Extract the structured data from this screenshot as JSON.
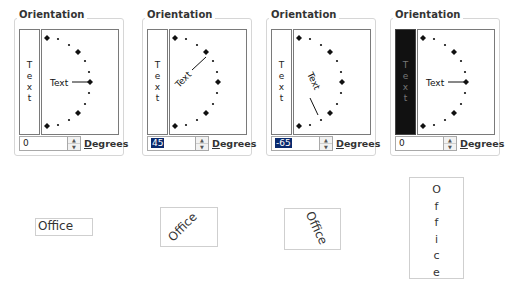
{
  "panels": [
    {
      "title": "Orientation",
      "vertical_text": [
        "T",
        "e",
        "x",
        "t"
      ],
      "vertical_selected": false,
      "dial_label": "Text",
      "angle": 0,
      "degrees_value": "0",
      "degrees_label": "Degrees",
      "input_selected": false
    },
    {
      "title": "Orientation",
      "vertical_text": [
        "T",
        "e",
        "x",
        "t"
      ],
      "vertical_selected": false,
      "dial_label": "Text",
      "angle": 45,
      "degrees_value": "45",
      "degrees_label": "Degrees",
      "input_selected": true
    },
    {
      "title": "Orientation",
      "vertical_text": [
        "T",
        "e",
        "x",
        "t"
      ],
      "vertical_selected": false,
      "dial_label": "Text",
      "angle": -65,
      "degrees_value": "-65",
      "degrees_label": "Degrees",
      "input_selected": true
    },
    {
      "title": "Orientation",
      "vertical_text": [
        "T",
        "e",
        "x",
        "t"
      ],
      "vertical_selected": true,
      "dial_label": "Text",
      "angle": 0,
      "degrees_value": "0",
      "degrees_label": "Degrees",
      "input_selected": false
    }
  ],
  "samples": [
    {
      "text": "Office",
      "orientation": "horizontal"
    },
    {
      "text": "Office",
      "orientation": "rotated 45"
    },
    {
      "text": "Office",
      "orientation": "rotated -65"
    },
    {
      "text": "Office",
      "orientation": "stacked vertical",
      "letters": [
        "O",
        "f",
        "f",
        "i",
        "c",
        "e"
      ]
    }
  ],
  "icons": {
    "spin_up": "▲",
    "spin_down": "▼"
  }
}
